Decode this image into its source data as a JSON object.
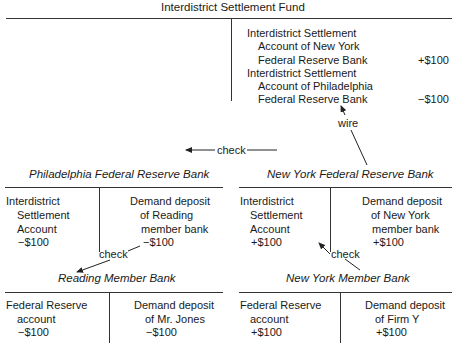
{
  "fund": {
    "title": "Interdistrict Settlement Fund",
    "right_lines": [
      "Interdistrict Settlement",
      "Account of New York",
      "Federal Reserve Bank",
      "Interdistrict Settlement",
      "Account of Philadelphia",
      "Federal Reserve Bank"
    ],
    "ny_amount": "+$100",
    "phila_amount": "−$100"
  },
  "arrows": {
    "wire": "wire",
    "check_top": "check",
    "check_left": "check",
    "check_right": "check"
  },
  "phila_fed": {
    "title": "Philadelphia Federal Reserve Bank",
    "left": [
      "Interdistrict",
      "Settlement",
      "Account",
      "−$100"
    ],
    "right": [
      "Demand deposit",
      "of Reading",
      "member bank",
      "−$100"
    ]
  },
  "ny_fed": {
    "title": "New York Federal Reserve Bank",
    "left": [
      "Interdistrict",
      "Settlement",
      "Account",
      "+$100"
    ],
    "right": [
      "Demand deposit",
      "of New York",
      "member bank",
      "+$100"
    ]
  },
  "reading_bank": {
    "title": "Reading Member Bank",
    "left": [
      "Federal Reserve",
      "account",
      "−$100"
    ],
    "right": [
      "Demand deposit",
      "of Mr. Jones",
      "−$100"
    ]
  },
  "ny_member": {
    "title": "New York Member Bank",
    "left": [
      "Federal Reserve",
      "account",
      "+$100"
    ],
    "right": [
      "Demand deposit",
      "of Firm Y",
      "+$100"
    ]
  }
}
